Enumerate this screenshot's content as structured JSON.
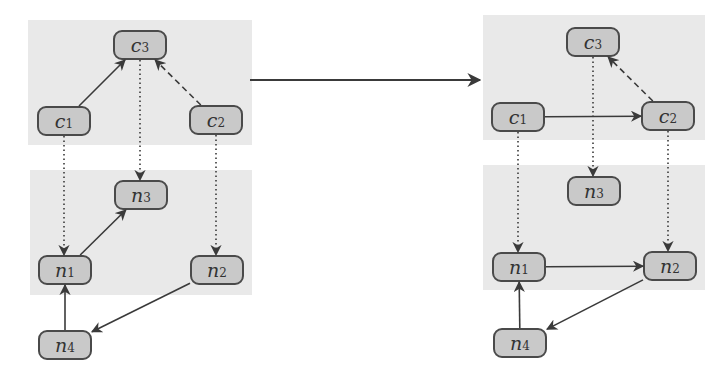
{
  "diagram": {
    "left": {
      "regions": [
        {
          "name": "top-layer",
          "x": 28,
          "y": 20,
          "w": 224,
          "h": 125
        },
        {
          "name": "bottom-layer",
          "x": 30,
          "y": 170,
          "w": 222,
          "h": 125
        }
      ],
      "nodes": [
        {
          "id": "c3",
          "base": "c",
          "sub": "3",
          "x": 113,
          "y": 30
        },
        {
          "id": "c1",
          "base": "c",
          "sub": "1",
          "x": 37,
          "y": 106
        },
        {
          "id": "c2",
          "base": "c",
          "sub": "2",
          "x": 189,
          "y": 105
        },
        {
          "id": "n3",
          "base": "n",
          "sub": "3",
          "x": 114,
          "y": 180
        },
        {
          "id": "n1",
          "base": "n",
          "sub": "1",
          "x": 38,
          "y": 255
        },
        {
          "id": "n2",
          "base": "n",
          "sub": "2",
          "x": 190,
          "y": 255
        },
        {
          "id": "n4",
          "base": "n",
          "sub": "4",
          "x": 38,
          "y": 330
        }
      ],
      "edges": [
        {
          "from": "c1",
          "to": "c3",
          "style": "solid"
        },
        {
          "from": "c2",
          "to": "c3",
          "style": "dashed"
        },
        {
          "from": "c1",
          "to": "n1",
          "style": "dotted"
        },
        {
          "from": "c3",
          "to": "n3",
          "style": "dotted"
        },
        {
          "from": "c2",
          "to": "n2",
          "style": "dotted"
        },
        {
          "from": "n1",
          "to": "n3",
          "style": "solid"
        },
        {
          "from": "n2",
          "to": "n4",
          "style": "solid"
        },
        {
          "from": "n4",
          "to": "n1",
          "style": "solid"
        }
      ]
    },
    "transform_arrow": {
      "x1": 250,
      "y1": 80,
      "x2": 480,
      "y2": 80,
      "style": "solid"
    },
    "right": {
      "regions": [
        {
          "name": "top-layer",
          "x": 483,
          "y": 15,
          "w": 222,
          "h": 125
        },
        {
          "name": "bottom-layer",
          "x": 483,
          "y": 165,
          "w": 222,
          "h": 125
        }
      ],
      "nodes": [
        {
          "id": "c3",
          "base": "c",
          "sub": "3",
          "x": 566,
          "y": 27
        },
        {
          "id": "c1",
          "base": "c",
          "sub": "1",
          "x": 491,
          "y": 102
        },
        {
          "id": "c2",
          "base": "c",
          "sub": "2",
          "x": 641,
          "y": 101
        },
        {
          "id": "n3",
          "base": "n",
          "sub": "3",
          "x": 567,
          "y": 176
        },
        {
          "id": "n1",
          "base": "n",
          "sub": "1",
          "x": 492,
          "y": 252
        },
        {
          "id": "n2",
          "base": "n",
          "sub": "2",
          "x": 643,
          "y": 251
        },
        {
          "id": "n4",
          "base": "n",
          "sub": "4",
          "x": 493,
          "y": 328
        }
      ],
      "edges": [
        {
          "from": "c1",
          "to": "c2",
          "style": "solid"
        },
        {
          "from": "c2",
          "to": "c3",
          "style": "dashed"
        },
        {
          "from": "c1",
          "to": "n1",
          "style": "dotted"
        },
        {
          "from": "c3",
          "to": "n3",
          "style": "dotted"
        },
        {
          "from": "c2",
          "to": "n2",
          "style": "dotted"
        },
        {
          "from": "n1",
          "to": "n2",
          "style": "solid"
        },
        {
          "from": "n2",
          "to": "n4",
          "style": "solid"
        },
        {
          "from": "n4",
          "to": "n1",
          "style": "solid"
        }
      ]
    },
    "colors": {
      "region": "#e9e9e9",
      "node_fill": "#c9c9c9",
      "node_border": "#4a4a4a",
      "edge": "#3a3a3a"
    }
  }
}
